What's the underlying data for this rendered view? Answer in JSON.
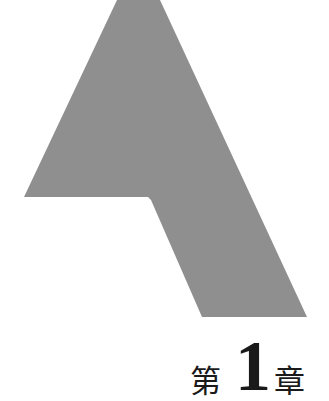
{
  "decoration": {
    "shape_name": "chapter-emblem",
    "color": "#8f8f8f"
  },
  "chapter": {
    "prefix": "第",
    "number": "1",
    "suffix": "章"
  }
}
